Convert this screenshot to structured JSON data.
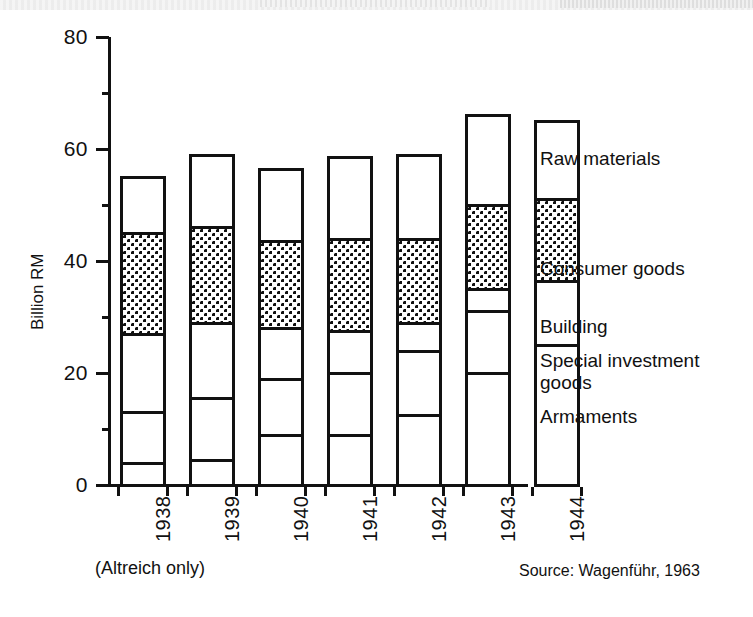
{
  "chart_data": {
    "type": "bar",
    "subtype": "stacked-vertical",
    "title": "",
    "xlabel": "",
    "ylabel": "Billion RM",
    "ylim": [
      0,
      80
    ],
    "yticks": [
      0,
      20,
      40,
      60,
      80
    ],
    "ytick_labels": [
      "0",
      "20",
      "40",
      "60",
      "80"
    ],
    "minor_yticks": [
      10,
      30,
      50,
      70
    ],
    "grid": false,
    "legend_position": "right",
    "categories": [
      "1938",
      "1939",
      "1940",
      "1941",
      "1942",
      "1943",
      "1944"
    ],
    "series": [
      {
        "name": "Armaments",
        "fill": "white",
        "values": [
          4.0,
          4.5,
          9.0,
          9.0,
          12.5,
          20.0,
          25.0
        ]
      },
      {
        "name": "Special investment goods",
        "fill": "white",
        "values": [
          9.0,
          11.0,
          10.0,
          11.0,
          11.5,
          11.0,
          11.5
        ]
      },
      {
        "name": "Building",
        "fill": "white",
        "values": [
          14.0,
          13.5,
          9.0,
          7.5,
          5.0,
          4.0,
          0.0
        ]
      },
      {
        "name": "Consumer goods",
        "fill": "dotted",
        "values": [
          18.0,
          17.0,
          15.5,
          16.5,
          15.0,
          15.0,
          14.5
        ]
      },
      {
        "name": "Raw materials",
        "fill": "white",
        "values": [
          10.0,
          13.0,
          13.0,
          14.5,
          15.0,
          16.0,
          14.0
        ]
      }
    ],
    "cumulative_tops": {
      "1938": [
        4.0,
        13.0,
        27.0,
        45.0,
        55.0
      ],
      "1939": [
        4.5,
        15.5,
        29.0,
        46.0,
        59.0
      ],
      "1940": [
        9.0,
        19.0,
        28.0,
        43.5,
        56.5
      ],
      "1941": [
        9.0,
        20.0,
        27.5,
        44.0,
        58.5
      ],
      "1942": [
        12.5,
        24.0,
        29.0,
        44.0,
        59.0
      ],
      "1943": [
        20.0,
        31.0,
        35.0,
        50.0,
        66.0
      ],
      "1944": [
        25.0,
        36.5,
        36.5,
        51.0,
        65.0
      ]
    },
    "totals": [
      55.0,
      59.0,
      56.5,
      58.5,
      59.0,
      66.0,
      65.0
    ]
  },
  "axis": {
    "y_label": "Billion RM",
    "y_tick_labels": [
      "80",
      "60",
      "40",
      "20",
      "0"
    ]
  },
  "legend": {
    "items": [
      {
        "label": "Raw materials"
      },
      {
        "label": "Consumer goods"
      },
      {
        "label": "Building"
      },
      {
        "label": "Special investment"
      },
      {
        "label": "goods"
      },
      {
        "label": "Armaments"
      }
    ]
  },
  "notes": {
    "altreich": "(Altreich only)",
    "source": "Source: Wagenführ, 1963"
  },
  "years": [
    "1938",
    "1939",
    "1940",
    "1941",
    "1942",
    "1943",
    "1944"
  ]
}
